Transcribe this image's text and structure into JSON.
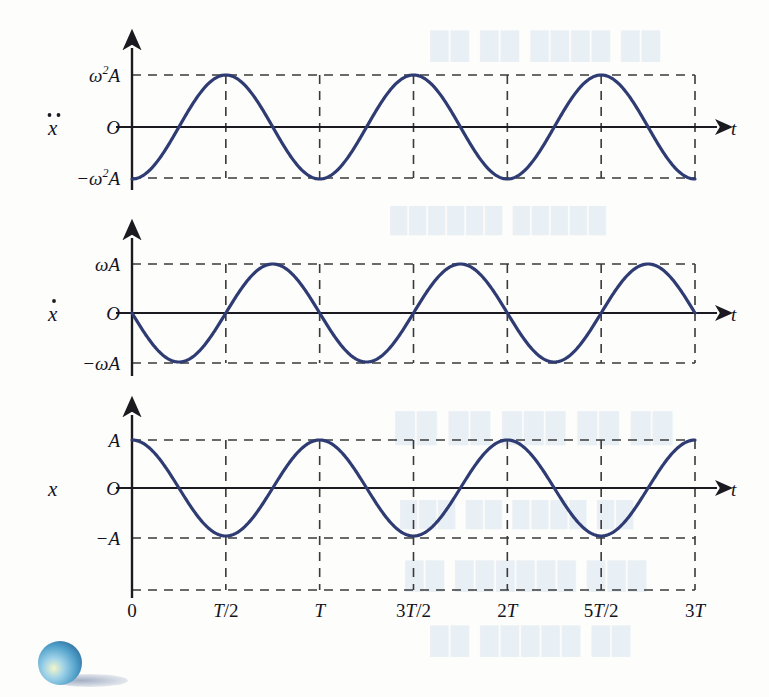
{
  "figure": {
    "curve_color": "#2e3c73",
    "axis_color": "#1a1a20",
    "grid_color": "#3a3a3a",
    "time_axis_label": "t",
    "origin_label": "O"
  },
  "panels": [
    {
      "id": "acceleration",
      "var_label": "ẍ",
      "var_label_base": "x",
      "var_label_dots": 2,
      "y_top_label": "ω²A",
      "y_top_base": "ω",
      "y_top_sup": "2",
      "y_top_tail": "A",
      "y_zero_label": "O",
      "y_bottom_label": "−ω²A",
      "y_bottom_lead": "−ω",
      "y_bottom_sup": "2",
      "y_bottom_tail": "A",
      "axis_label": "t",
      "phase": "minus_cos",
      "amplitude_name": "ω²A"
    },
    {
      "id": "velocity",
      "var_label": "ẋ",
      "var_label_base": "x",
      "var_label_dots": 1,
      "y_top_label": "ωA",
      "y_top_base": "ω",
      "y_top_sup": "",
      "y_top_tail": "A",
      "y_zero_label": "O",
      "y_bottom_label": "−ωA",
      "y_bottom_lead": "−ω",
      "y_bottom_sup": "",
      "y_bottom_tail": "A",
      "axis_label": "t",
      "phase": "minus_sin",
      "amplitude_name": "ωA"
    },
    {
      "id": "displacement",
      "var_label": "x",
      "var_label_base": "x",
      "var_label_dots": 0,
      "y_top_label": "A",
      "y_top_base": "",
      "y_top_sup": "",
      "y_top_tail": "A",
      "y_zero_label": "O",
      "y_bottom_label": "−A",
      "y_bottom_lead": "−",
      "y_bottom_sup": "",
      "y_bottom_tail": "A",
      "axis_label": "t",
      "phase": "cos",
      "amplitude_name": "A"
    }
  ],
  "x_ticks": [
    {
      "label": "0",
      "value": 0.0
    },
    {
      "label": "T/2",
      "value": 0.5
    },
    {
      "label": "T",
      "value": 1.0
    },
    {
      "label": "3T/2",
      "value": 1.5
    },
    {
      "label": "2T",
      "value": 2.0
    },
    {
      "label": "5T/2",
      "value": 2.5
    },
    {
      "label": "3T",
      "value": 3.0
    }
  ],
  "chart_data": {
    "type": "line",
    "xlabel": "t",
    "ylabel": "",
    "xlim": [
      0,
      3
    ],
    "x_tick_labels": [
      "0",
      "T/2",
      "T",
      "3T/2",
      "2T",
      "5T/2",
      "3T"
    ],
    "x_tick_values": [
      0,
      0.5,
      1.0,
      1.5,
      2.0,
      2.5,
      3.0
    ],
    "grid": "dashed",
    "legend": "none",
    "series": [
      {
        "name": "acceleration",
        "ylabel": "ẍ",
        "formula": "-ω²A·cos(2πt/T)",
        "ylim": [
          -1,
          1
        ],
        "y_tick_labels": [
          "ω²A",
          "O",
          "-ω²A"
        ],
        "y_tick_values": [
          1,
          0,
          -1
        ],
        "samples_t": [
          0,
          0.25,
          0.5,
          0.75,
          1.0,
          1.25,
          1.5,
          1.75,
          2.0,
          2.25,
          2.5,
          2.75,
          3.0
        ],
        "samples_y": [
          -1,
          0,
          1,
          0,
          -1,
          0,
          1,
          0,
          -1,
          0,
          1,
          0,
          -1
        ]
      },
      {
        "name": "velocity",
        "ylabel": "ẋ",
        "formula": "-ωA·sin(2πt/T)",
        "ylim": [
          -1,
          1
        ],
        "y_tick_labels": [
          "ωA",
          "O",
          "-ωA"
        ],
        "y_tick_values": [
          1,
          0,
          -1
        ],
        "samples_t": [
          0,
          0.25,
          0.5,
          0.75,
          1.0,
          1.25,
          1.5,
          1.75,
          2.0,
          2.25,
          2.5,
          2.75,
          3.0
        ],
        "samples_y": [
          0,
          -1,
          0,
          1,
          0,
          -1,
          0,
          1,
          0,
          -1,
          0,
          1,
          0
        ]
      },
      {
        "name": "displacement",
        "ylabel": "x",
        "formula": "A·cos(2πt/T)",
        "ylim": [
          -1,
          1
        ],
        "y_tick_labels": [
          "A",
          "O",
          "-A"
        ],
        "y_tick_values": [
          1,
          0,
          -1
        ],
        "samples_t": [
          0,
          0.25,
          0.5,
          0.75,
          1.0,
          1.25,
          1.5,
          1.75,
          2.0,
          2.25,
          2.5,
          2.75,
          3.0
        ],
        "samples_y": [
          1,
          0,
          -1,
          0,
          1,
          0,
          -1,
          0,
          1,
          0,
          -1,
          0,
          1
        ]
      }
    ]
  },
  "decoration": {
    "ball_label": "blue-sphere-bullet"
  },
  "bleed_through": [
    {
      "text": "██ ██ ████ ██",
      "x": 430,
      "y": 30,
      "size": 26
    },
    {
      "text": "██████ █████",
      "x": 390,
      "y": 206,
      "size": 24
    },
    {
      "text": "██ ██ ███ ██   ██",
      "x": 395,
      "y": 412,
      "size": 28
    },
    {
      "text": "███ ██ ████ ██",
      "x": 400,
      "y": 500,
      "size": 24
    },
    {
      "text": "██ ██████ ███",
      "x": 405,
      "y": 560,
      "size": 26
    },
    {
      "text": "██ █████ ██",
      "x": 430,
      "y": 625,
      "size": 26
    }
  ]
}
